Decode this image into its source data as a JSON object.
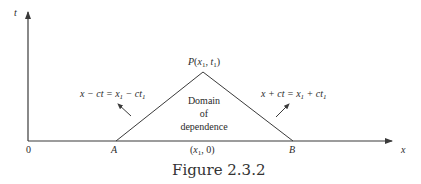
{
  "figure": {
    "caption": "Figure 2.3.2",
    "axes": {
      "x_label": "x",
      "t_label": "t",
      "origin_label": "0"
    },
    "points": {
      "A": "A",
      "B": "B",
      "apex": {
        "letter": "P",
        "open": "(",
        "x": "x",
        "x_sub": "1",
        "sep": ", ",
        "t": "t",
        "t_sub": "1",
        "close": ")"
      },
      "foot": {
        "open": "(",
        "x": "x",
        "x_sub": "1",
        "rest": ", 0)"
      }
    },
    "region_label": [
      "Domain",
      "of",
      "dependence"
    ],
    "left_characteristic": {
      "lhs": "x − ct = x",
      "sub1": "1",
      "mid": " − ct",
      "sub2": "1"
    },
    "right_characteristic": {
      "lhs": "x + ct = x",
      "sub1": "1",
      "mid": " + ct",
      "sub2": "1"
    },
    "colors": {
      "line": "#3a3a3a",
      "background": "#ffffff"
    }
  }
}
